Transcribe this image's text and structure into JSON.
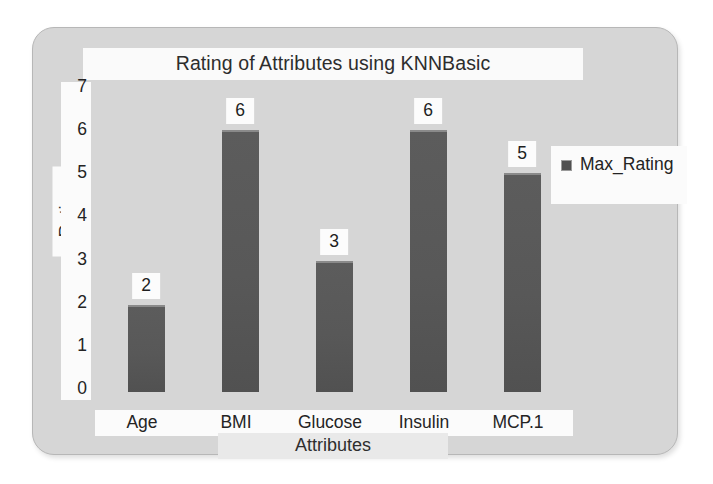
{
  "chart_data": {
    "type": "bar",
    "title": "Rating of Attributes using KNNBasic",
    "xlabel": "Attributes",
    "ylabel": "Rating",
    "categories": [
      "Age",
      "BMI",
      "Glucose",
      "Insulin",
      "MCP.1"
    ],
    "values": [
      2,
      6,
      3,
      6,
      5
    ],
    "series": [
      {
        "name": "Max_Rating",
        "values": [
          2,
          6,
          3,
          6,
          5
        ]
      }
    ],
    "ylim": [
      0,
      7
    ],
    "yticks": [
      0,
      1,
      2,
      3,
      4,
      5,
      6,
      7
    ],
    "ytick_labels": [
      "0",
      "1",
      "2",
      "3",
      "4",
      "5",
      "6",
      "7"
    ],
    "data_labels": [
      "2",
      "6",
      "3",
      "6",
      "5"
    ],
    "grid": false,
    "legend": {
      "position": "top-right",
      "entries": [
        "Max_Rating"
      ]
    },
    "colors": {
      "bar": "#585858",
      "bar_top_highlight": "#8a8a8a",
      "plot_background": "#d6d6d6",
      "frame_border": "#b7b7b7",
      "label_background": "#fbfbfb",
      "text": "#242424",
      "page_background": "#ffffff"
    }
  },
  "legend": {
    "swatch_name": "legend-color-swatch",
    "label": "Max_Rating"
  }
}
